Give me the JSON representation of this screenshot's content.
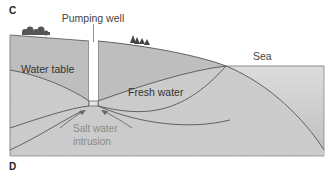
{
  "panels": {
    "top_letter": "C",
    "bottom_letter": "D"
  },
  "labels": {
    "pumping_well": "Pumping well",
    "water_table": "Water table",
    "fresh_water": "Fresh water",
    "salt_water_line1": "Salt water",
    "salt_water_line2": "intrusion",
    "sea": "Sea"
  },
  "colors": {
    "ground": "#c9c9c9",
    "ground_upper": "#bdbdbd",
    "sea": "#d6d6d6",
    "lines": "#555555",
    "text_dark": "#333333",
    "text_light": "#8a8a8a"
  }
}
